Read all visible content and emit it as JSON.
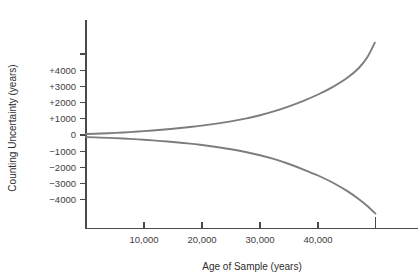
{
  "chart_data": {
    "type": "line",
    "title": "",
    "subtitle": "",
    "xlabel": "Age of Sample (years)",
    "ylabel": "Counting Uncertainty (years)",
    "xlim": [
      0,
      50000
    ],
    "ylim": [
      -5000,
      5500
    ],
    "grid": false,
    "legend": null,
    "xticks": [
      {
        "value": 10000,
        "label": "10,000"
      },
      {
        "value": 20000,
        "label": "20,000"
      },
      {
        "value": 30000,
        "label": "30,000"
      },
      {
        "value": 40000,
        "label": "40,000"
      }
    ],
    "yticks": [
      {
        "value": 4000,
        "label": "+4000"
      },
      {
        "value": 3000,
        "label": "+3000"
      },
      {
        "value": 2000,
        "label": "+2000"
      },
      {
        "value": 1000,
        "label": "+1000"
      },
      {
        "value": 0,
        "label": "0"
      },
      {
        "value": -1000,
        "label": "−1000"
      },
      {
        "value": -2000,
        "label": "−2000"
      },
      {
        "value": -3000,
        "label": "−3000"
      },
      {
        "value": -4000,
        "label": "−4000"
      }
    ],
    "series": [
      {
        "name": "upper-uncertainty",
        "color": "#7d7d7d",
        "x": [
          0,
          2500,
          5000,
          7500,
          10000,
          12500,
          15000,
          17500,
          20000,
          22500,
          25000,
          27500,
          30000,
          32500,
          35000,
          37500,
          40000,
          42500,
          45000,
          47000,
          48500,
          49800
        ],
        "values": [
          60,
          90,
          130,
          180,
          240,
          310,
          390,
          480,
          580,
          700,
          840,
          1010,
          1220,
          1470,
          1770,
          2110,
          2500,
          2960,
          3520,
          4120,
          4800,
          5700
        ]
      },
      {
        "name": "lower-uncertainty",
        "color": "#7d7d7d",
        "x": [
          0,
          2500,
          5000,
          7500,
          10000,
          12500,
          15000,
          17500,
          20000,
          22500,
          25000,
          27500,
          30000,
          32500,
          35000,
          37500,
          40000,
          42500,
          45000,
          47000,
          48500,
          49900
        ],
        "values": [
          -130,
          -160,
          -195,
          -240,
          -295,
          -360,
          -435,
          -520,
          -620,
          -740,
          -880,
          -1050,
          -1250,
          -1490,
          -1790,
          -2130,
          -2500,
          -2930,
          -3450,
          -3950,
          -4380,
          -4850
        ]
      }
    ],
    "annotations": [
      {
        "name": "terminal-axis-tick",
        "x": 49900,
        "note": "unlabeled tick on x-axis at curve end"
      },
      {
        "name": "upper-extra-ytick",
        "y": 5000,
        "note": "unlabeled tick above +4000"
      }
    ]
  }
}
